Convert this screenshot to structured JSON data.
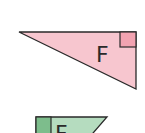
{
  "shapes": [
    {
      "id": "triangle-F",
      "type": "right-triangle",
      "label": "F",
      "fill": "#f7c6cf",
      "stroke": "#2a2a2a",
      "right_angle_marker_fill": "#f2a3b1",
      "vertices": [
        [
          19,
          32
        ],
        [
          136,
          32
        ],
        [
          136,
          89
        ]
      ],
      "right_angle_at": [
        136,
        32
      ]
    },
    {
      "id": "shape-green",
      "type": "right-triangle-partial",
      "label": "F",
      "fill": "#b5dcbf",
      "stroke": "#2a2a2a",
      "right_angle_marker_fill": "#7dbd8c",
      "top_edge": [
        [
          36,
          117
        ],
        [
          107,
          117
        ]
      ],
      "right_angle_at": [
        36,
        117
      ]
    }
  ]
}
